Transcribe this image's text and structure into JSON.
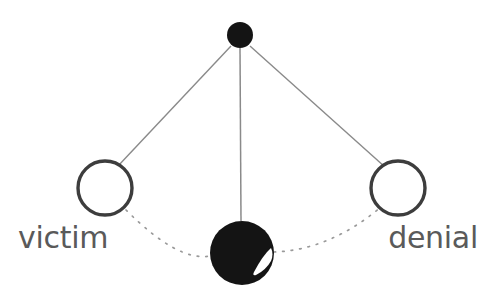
{
  "diagram": {
    "background_color": "#ffffff",
    "edge_color": "#8a8a8a",
    "dotted_edge_color": "#9a9a9a",
    "filled_node_color": "#141414",
    "open_node_stroke_color": "#3d3d3d",
    "open_node_fill_color": "#ffffff",
    "label_color": "#5a5a5a",
    "highlight_color": "#ffffff",
    "nodes": [
      {
        "id": "top",
        "name": "top-filled-node",
        "label": "",
        "cx": 240,
        "cy": 35,
        "r": 13,
        "style": "filled"
      },
      {
        "id": "left",
        "name": "victim-node",
        "label": "victim",
        "cx": 105,
        "cy": 188,
        "r": 27,
        "style": "open"
      },
      {
        "id": "right",
        "name": "denial-node",
        "label": "denial",
        "cx": 398,
        "cy": 188,
        "r": 27,
        "style": "open"
      },
      {
        "id": "bottom",
        "name": "bottom-filled-node",
        "label": "",
        "cx": 242,
        "cy": 253,
        "r": 32,
        "style": "filled-highlight"
      }
    ],
    "edges": [
      {
        "name": "edge-top-left",
        "from": "top",
        "to": "left",
        "style": "solid",
        "path": "M 231 46 L 118 166"
      },
      {
        "name": "edge-top-bottom",
        "from": "top",
        "to": "bottom",
        "style": "solid",
        "path": "M 240 48 L 241 221"
      },
      {
        "name": "edge-top-right",
        "from": "top",
        "to": "right",
        "style": "solid",
        "path": "M 250 46 L 385 167"
      },
      {
        "name": "edge-left-bottom",
        "from": "left",
        "to": "bottom",
        "style": "dotted",
        "path": "M 126 210 Q 178 262 210 256"
      },
      {
        "name": "edge-bottom-right",
        "from": "bottom",
        "to": "right",
        "style": "dotted",
        "path": "M 274 252 Q 330 250 381 207"
      }
    ],
    "labels": [
      {
        "name": "victim-label",
        "text": "victim",
        "x": 18,
        "y": 248,
        "anchor": "start"
      },
      {
        "name": "denial-label",
        "text": "denial",
        "x": 478,
        "y": 248,
        "anchor": "end"
      }
    ]
  }
}
